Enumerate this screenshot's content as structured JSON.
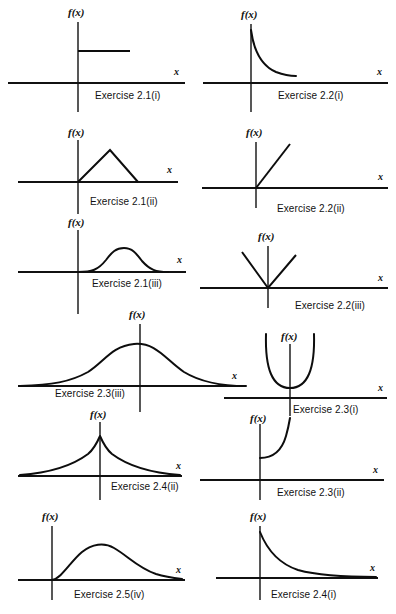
{
  "figure": {
    "axis_label_y": "f(x)",
    "axis_label_x": "x",
    "stroke_color": "#111111",
    "background_color": "#ffffff"
  },
  "panels": [
    {
      "id": "p1",
      "caption": "Exercise 2.1(i)",
      "y_label": "f(x)",
      "x_label": "x",
      "shape": "uniform-step",
      "description": "horizontal constant segment to the right of the vertical axis"
    },
    {
      "id": "p2",
      "caption": "Exercise 2.2(i)",
      "y_label": "f(x)",
      "x_label": "x",
      "shape": "decaying-convex",
      "description": "curve descending steeply from high on the vertical axis then flattening"
    },
    {
      "id": "p3",
      "caption": "Exercise 2.1(ii)",
      "y_label": "f(x)",
      "x_label": "x",
      "shape": "triangular",
      "description": "triangular density rising from origin to a peak then falling back to the axis"
    },
    {
      "id": "p4",
      "caption": "Exercise 2.2(ii)",
      "y_label": "f(x)",
      "x_label": "x",
      "shape": "increasing-line",
      "description": "straight line rising from the origin"
    },
    {
      "id": "p5",
      "caption": "Exercise 2.1(iii)",
      "y_label": "f(x)",
      "x_label": "x",
      "shape": "bell-right",
      "description": "smooth bell shaped hump to the right of the vertical axis"
    },
    {
      "id": "p6",
      "caption": "Exercise 2.2(iii)",
      "y_label": "f(x)",
      "x_label": "x",
      "shape": "v-shape",
      "description": "V shape with vertex at the origin and two straight arms rising outward"
    },
    {
      "id": "p7",
      "caption": "Exercise 2.3(iii)",
      "y_label": "f(x)",
      "x_label": "x",
      "shape": "wide-bell",
      "description": "wide normal bell curve peaking near the vertical axis"
    },
    {
      "id": "p8",
      "caption": "Exercise 2.3(i)",
      "y_label": "f(x)",
      "x_label": "x",
      "shape": "parabola-u",
      "description": "U shaped parabola with minimum just above the horizontal axis"
    },
    {
      "id": "p9",
      "caption": "Exercise 2.4(ii)",
      "y_label": "f(x)",
      "x_label": "x",
      "shape": "laplace-peak",
      "description": "double exponential with a sharp cusp peak on the vertical axis and tails both ways"
    },
    {
      "id": "p10",
      "caption": "Exercise 2.3(ii)",
      "y_label": "f(x)",
      "x_label": "x",
      "shape": "convex-increasing",
      "description": "curve starting on the vertical axis and rising steeply upward to the right"
    },
    {
      "id": "p11",
      "caption": "Exercise 2.5(iv)",
      "y_label": "f(x)",
      "x_label": "x",
      "shape": "right-skewed",
      "description": "right skewed unimodal density rising from the origin with a long right tail"
    },
    {
      "id": "p12",
      "caption": "Exercise 2.4(i)",
      "y_label": "f(x)",
      "x_label": "x",
      "shape": "exponential-decay",
      "description": "exponential decay from a peak on the vertical axis toward the horizontal axis"
    }
  ]
}
